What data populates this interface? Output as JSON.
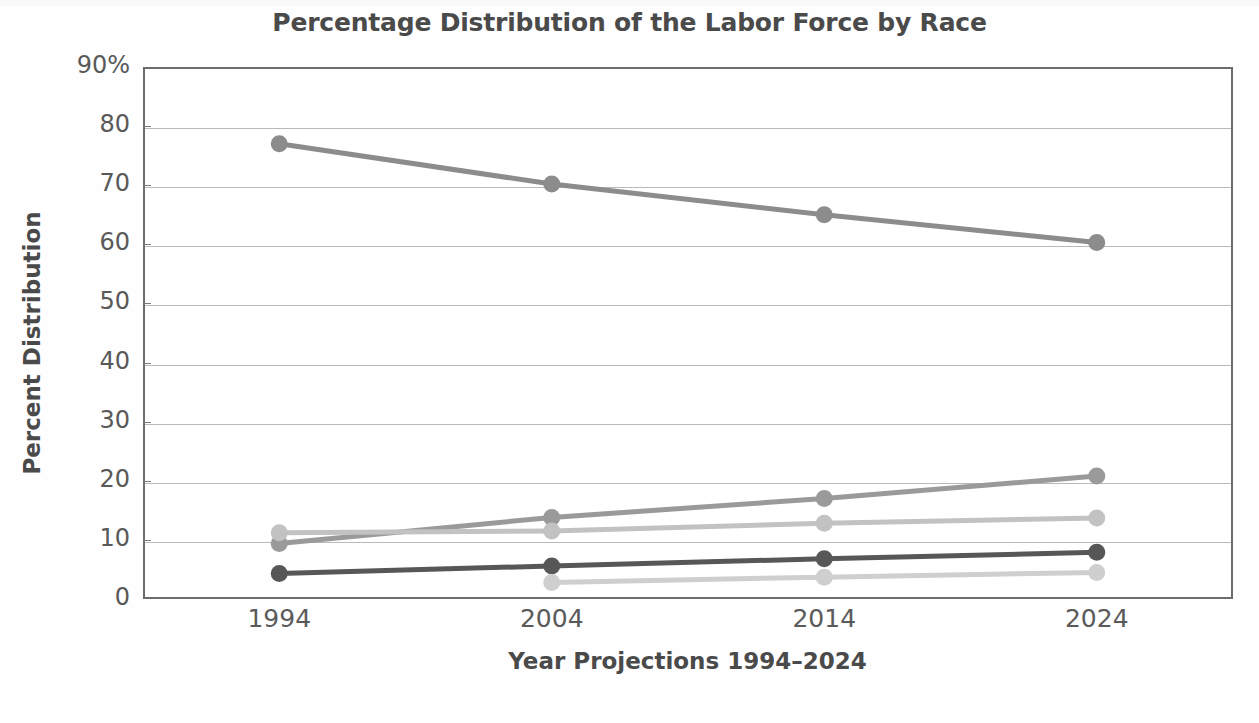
{
  "chart_data": {
    "type": "line",
    "title": "Percentage Distribution of the Labor Force by Race",
    "xlabel": "Year Projections 1994–2024",
    "ylabel": "Percent Distribution",
    "categories": [
      "1994",
      "2004",
      "2014",
      "2024"
    ],
    "x": [
      1994,
      2004,
      2014,
      2024
    ],
    "ylim": [
      0,
      90
    ],
    "yticks": [
      0,
      10,
      20,
      30,
      40,
      50,
      60,
      70,
      80,
      90
    ],
    "ytick_labels": [
      "0",
      "10",
      "20",
      "30",
      "40",
      "50",
      "60",
      "70",
      "80",
      "90%"
    ],
    "grid": true,
    "legend": "none",
    "series": [
      {
        "name": "series-1",
        "color": "#8c8c8c",
        "values": [
          77.0,
          70.2,
          65.0,
          60.3
        ]
      },
      {
        "name": "series-2",
        "color": "#9a9a9a",
        "values": [
          9.4,
          13.8,
          17.0,
          20.8
        ]
      },
      {
        "name": "series-3",
        "color": "#c2c2c2",
        "values": [
          11.2,
          11.5,
          12.8,
          13.7
        ]
      },
      {
        "name": "series-4",
        "color": "#575757",
        "values": [
          4.3,
          5.6,
          6.8,
          7.9
        ]
      },
      {
        "name": "series-5",
        "color": "#cfcfcf",
        "values": [
          null,
          2.8,
          3.7,
          4.5
        ]
      }
    ]
  },
  "axes": {
    "y_tick_labels": [
      "90%",
      "80",
      "70",
      "60",
      "50",
      "40",
      "30",
      "20",
      "10",
      "0"
    ],
    "x_tick_labels": [
      "1994",
      "2004",
      "2014",
      "2024"
    ]
  }
}
